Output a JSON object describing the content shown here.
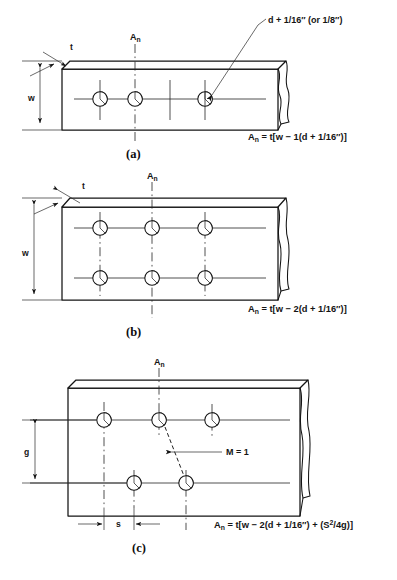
{
  "figure": {
    "title_semantic": "net-area-of-bolted-plates",
    "panels": [
      {
        "id": "a",
        "label": "(a)",
        "formula": "Aₙ = t[w − 1(d + 1/16″)]",
        "formula_parts": {
          "lhs": "A",
          "lhs_sub": "n",
          "rhs": " = t[w − 1(d + 1/16″)]"
        },
        "callout": "d + 1/16″ (or 1/8″)",
        "section_label": "A",
        "section_label_sub": "n",
        "dimensions": [
          {
            "name": "thickness",
            "label": "t"
          },
          {
            "name": "width",
            "label": "w"
          }
        ],
        "hole_rows": 1,
        "hole_columns": 3,
        "hole_count": 3,
        "holes_deducted": 1
      },
      {
        "id": "b",
        "label": "(b)",
        "formula": "Aₙ = t[w − 2(d + 1/16″)]",
        "formula_parts": {
          "lhs": "A",
          "lhs_sub": "n",
          "rhs": " = t[w − 2(d + 1/16″)]"
        },
        "section_label": "A",
        "section_label_sub": "n",
        "dimensions": [
          {
            "name": "thickness",
            "label": "t"
          },
          {
            "name": "width",
            "label": "w"
          }
        ],
        "hole_rows": 2,
        "hole_columns": 3,
        "hole_count": 6,
        "holes_deducted": 2
      },
      {
        "id": "c",
        "label": "(c)",
        "formula": "Aₙ = t[w − 2(d + 1/16″) + (S²/4g)]",
        "formula_parts": {
          "lhs": "A",
          "lhs_sub": "n",
          "rhs_1": " = t[w − 2(d + 1/16″) + (S",
          "rhs_sup": "2",
          "rhs_2": "/4g)]"
        },
        "section_label": "A",
        "section_label_sub": "n",
        "stagger_note": "M = 1",
        "dimensions": [
          {
            "name": "gage",
            "label": "g"
          },
          {
            "name": "pitch",
            "label": "s"
          }
        ],
        "hole_rows": 2,
        "hole_top_count": 3,
        "hole_bottom_count": 2,
        "hole_count": 5,
        "holes_deducted": 2
      }
    ],
    "colors": {
      "ink": "#141414",
      "paper": "#ffffff",
      "thin_line": "#242424"
    }
  }
}
